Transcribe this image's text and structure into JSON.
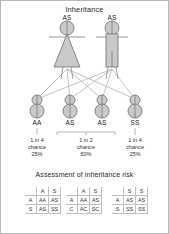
{
  "diagram": {
    "title": "Inheritance",
    "parents": [
      {
        "sex": "female",
        "genotype": "AS"
      },
      {
        "sex": "male",
        "genotype": "AS"
      }
    ],
    "children": [
      {
        "genotype": "AA"
      },
      {
        "genotype": "AS"
      },
      {
        "genotype": "AS"
      },
      {
        "genotype": "SS"
      }
    ],
    "outcomes": [
      {
        "ratio": "1 in 4",
        "word": "chance",
        "percent": "25%"
      },
      {
        "ratio": "1 in 2",
        "word": "chance",
        "percent": "50%"
      },
      {
        "ratio": "1 in 4",
        "word": "chance",
        "percent": "25%"
      }
    ]
  },
  "risk": {
    "title": "Assessment of inheritance risk",
    "squares": [
      {
        "cols": [
          "A",
          "S"
        ],
        "rows": [
          "A",
          "S"
        ],
        "cells": [
          [
            "AA",
            "AS"
          ],
          [
            "AS",
            "SS"
          ]
        ]
      },
      {
        "cols": [
          "A",
          "S"
        ],
        "rows": [
          "A",
          "C"
        ],
        "cells": [
          [
            "AA",
            "AS"
          ],
          [
            "AC",
            "SC"
          ]
        ]
      },
      {
        "cols": [
          "S",
          "S"
        ],
        "rows": [
          "A",
          "S"
        ],
        "cells": [
          [
            "AS",
            "AS"
          ],
          [
            "SS",
            "SS"
          ]
        ]
      }
    ]
  },
  "colors": {
    "fill": "#c9c9c9",
    "stroke": "#6f6f6f",
    "line": "#8a8a8a",
    "text": "#222222"
  }
}
